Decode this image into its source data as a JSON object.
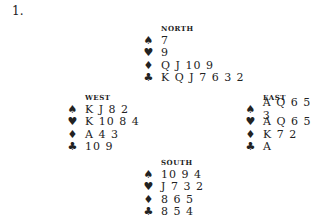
{
  "problem_number": "1.",
  "hands": {
    "north": {
      "label": "NORTH",
      "spades": "7",
      "hearts": "9",
      "diamonds": "Q J 10 9",
      "clubs": "K Q J 7 6 3 2"
    },
    "west": {
      "label": "WEST",
      "spades": "K J 8 2",
      "hearts": "K 10 8 4",
      "diamonds": "A 4 3",
      "clubs": "10 9"
    },
    "east": {
      "label": "EAST",
      "spades": "A Q 6 5 3",
      "hearts": "A Q 6 5",
      "diamonds": "K 7 2",
      "clubs": "A"
    },
    "south": {
      "label": "SOUTH",
      "spades": "10 9 4",
      "hearts": "J 7 3 2",
      "diamonds": "8 6 5",
      "clubs": "8 5 4"
    }
  },
  "suit_symbols": {
    "spades": "♠",
    "hearts": "♥",
    "diamonds": "♦",
    "clubs": "♣"
  }
}
